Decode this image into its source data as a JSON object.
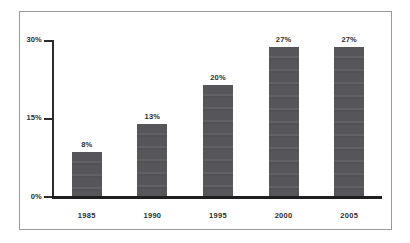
{
  "chart_data": {
    "type": "bar",
    "title": "",
    "subtitle": "",
    "xlabel": "",
    "ylabel": "",
    "categories": [
      "1985",
      "1990",
      "1995",
      "2000",
      "2005"
    ],
    "values": [
      8,
      13,
      20,
      27,
      27
    ],
    "value_labels": [
      "8%",
      "13%",
      "20%",
      "27%",
      "27%"
    ],
    "ylim": [
      0,
      30
    ],
    "y_ticks": [
      0,
      15,
      30
    ],
    "y_tick_labels": [
      "0%",
      "15%",
      "30%"
    ],
    "grid": false,
    "legend": false,
    "legend_position": "none",
    "bar_color": "#56565a",
    "axis_color": "#1f1f1f",
    "text_color": "#2e2e2e",
    "frame_color": "#9a9a9a",
    "background": "#ffffff"
  },
  "axis": {
    "y_labels": {
      "top": "30%",
      "middle": "15%",
      "bottom": "0%"
    }
  }
}
